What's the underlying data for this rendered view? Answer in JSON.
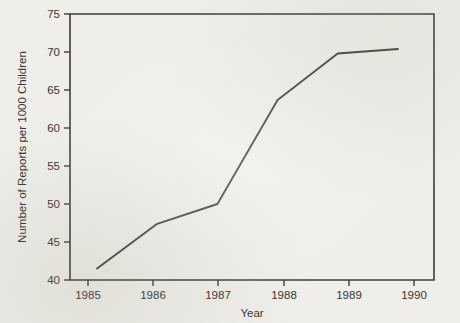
{
  "chart_data": {
    "type": "line",
    "title": "",
    "xlabel": "Year",
    "ylabel": "Number of Reports per 1000 Children",
    "x": [
      1985,
      1986,
      1987,
      1988,
      1989,
      1990
    ],
    "xticklabels": [
      "1985",
      "1986",
      "1987",
      "1988",
      "1989",
      "1990"
    ],
    "yticklabels": [
      "40",
      "45",
      "50",
      "55",
      "60",
      "65",
      "70",
      "75"
    ],
    "yticks": [
      40,
      45,
      50,
      55,
      60,
      65,
      70,
      75
    ],
    "xlim": [
      1984.55,
      1990.6
    ],
    "ylim": [
      40,
      75
    ],
    "grid": false,
    "legend": false,
    "series": [
      {
        "name": "Reports per 1000 children",
        "values": [
          41.5,
          47.4,
          50.0,
          63.7,
          69.8,
          70.4
        ]
      }
    ],
    "line_color": "#40443a",
    "axis_color": "#3b3f36",
    "background_color": "#efeee8"
  },
  "figure": {
    "y_axis_title": "Number of Reports per 1000 Children",
    "x_axis_title": "Year"
  }
}
